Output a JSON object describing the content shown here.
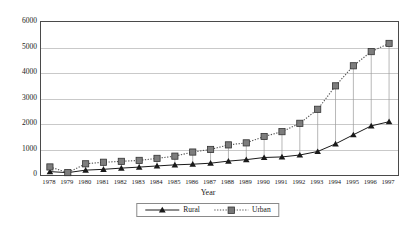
{
  "chart_data": {
    "type": "line",
    "title": "",
    "xlabel": "Year",
    "ylabel": "",
    "ylim": [
      0,
      6000
    ],
    "ytick_step": 1000,
    "grid": true,
    "legend_position": "bottom-center",
    "droplines": true,
    "categories": [
      "1978",
      "1979",
      "1980",
      "1981",
      "1982",
      "1983",
      "1984",
      "1985",
      "1986",
      "1987",
      "1988",
      "1989",
      "1990",
      "1991",
      "1992",
      "1993",
      "1994",
      "1995",
      "1996",
      "1997"
    ],
    "ytick_labels": [
      "0",
      "1000",
      "2000",
      "3000",
      "4000",
      "5000",
      "6000"
    ],
    "series": [
      {
        "name": "Rural",
        "marker": "triangle",
        "line_style": "solid",
        "color": "#1a1a1a",
        "values": [
          133,
          92,
          191,
          223,
          270,
          310,
          355,
          398,
          424,
          463,
          545,
          602,
          686,
          709,
          784,
          922,
          1221,
          1578,
          1926,
          2090
        ]
      },
      {
        "name": "Urban",
        "marker": "square",
        "line_style": "dotted",
        "color": "#555555",
        "values": [
          316,
          94,
          439,
          500,
          535,
          573,
          652,
          739,
          900,
          1002,
          1181,
          1260,
          1510,
          1700,
          2027,
          2577,
          3496,
          4283,
          4839,
          5160
        ]
      }
    ]
  },
  "legend": {
    "items": [
      {
        "label": "Rural"
      },
      {
        "label": "Urban"
      }
    ]
  },
  "axis_titles": {
    "x": "Year"
  },
  "colors": {
    "rural": "#1a1a1a",
    "urban": "#555555",
    "gridline": "#c9c9c9",
    "plot_border": "#4a4a4a",
    "dropline": "#9a9a9a"
  }
}
